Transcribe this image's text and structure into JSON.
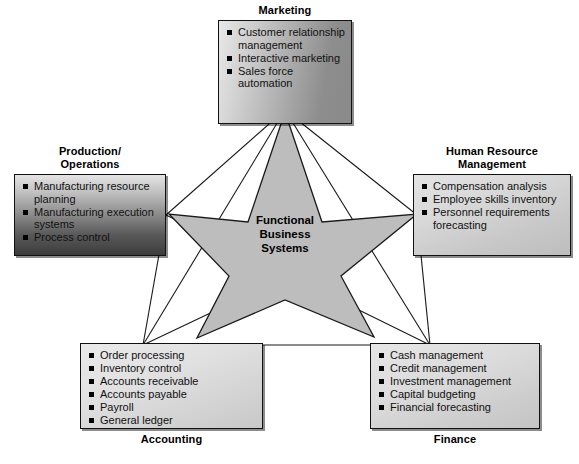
{
  "diagram": {
    "center": {
      "label": "Functional\nBusiness\nSystems",
      "shape": "five-point-star",
      "fill": "#bdbdbd",
      "stroke": "#1a1a1a"
    },
    "nodes": [
      {
        "id": "marketing",
        "title": "Marketing",
        "title_position": "above",
        "items": [
          "Customer relationship management",
          "Interactive marketing",
          "Sales force automation"
        ]
      },
      {
        "id": "production",
        "title": "Production/\nOperations",
        "title_position": "above",
        "items": [
          "Manufacturing resource planning",
          "Manufacturing execution systems",
          "Process control"
        ]
      },
      {
        "id": "human-resource-management",
        "title": "Human Resource\nManagement",
        "title_position": "above",
        "items": [
          "Compensation analysis",
          "Employee skills inventory",
          "Personnel requirements forecasting"
        ]
      },
      {
        "id": "accounting",
        "title": "Accounting",
        "title_position": "below",
        "items": [
          "Order processing",
          "Inventory control",
          "Accounts receivable",
          "Accounts payable",
          "Payroll",
          "General ledger"
        ]
      },
      {
        "id": "finance",
        "title": "Finance",
        "title_position": "below",
        "items": [
          "Cash management",
          "Credit management",
          "Investment management",
          "Capital budgeting",
          "Financial forecasting"
        ]
      }
    ]
  }
}
